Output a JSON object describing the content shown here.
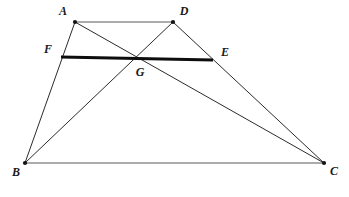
{
  "figure": {
    "canvas": {
      "width": 349,
      "height": 197,
      "background": "#ffffff"
    },
    "colors": {
      "thin_stroke": "#2b2b2b",
      "thin_stroke_light": "#585858",
      "thick_stroke": "#0d0d0d",
      "vertex": "#121212",
      "label": "#1a1a1a"
    },
    "points": [
      {
        "id": "A",
        "label": "A",
        "x": 75,
        "y": 22,
        "label_x": 63,
        "label_y": 12,
        "dot": true
      },
      {
        "id": "D",
        "label": "D",
        "x": 173,
        "y": 22,
        "label_x": 184,
        "label_y": 12,
        "dot": true
      },
      {
        "id": "F",
        "label": "F",
        "x": 61,
        "y": 57,
        "label_x": 48,
        "label_y": 50,
        "dot": false
      },
      {
        "id": "E",
        "label": "E",
        "x": 213,
        "y": 60,
        "label_x": 225,
        "label_y": 53,
        "dot": false
      },
      {
        "id": "G",
        "label": "G",
        "x": 138,
        "y": 58,
        "label_x": 140,
        "label_y": 73,
        "dot": false
      },
      {
        "id": "B",
        "label": "B",
        "x": 25,
        "y": 163,
        "label_x": 16,
        "label_y": 173,
        "dot": true
      },
      {
        "id": "C",
        "label": "C",
        "x": 324,
        "y": 163,
        "label_x": 334,
        "label_y": 172,
        "dot": true
      }
    ],
    "segments": [
      {
        "id": "AD",
        "from": "A",
        "to": "D",
        "weight": "thin-light",
        "desc": "top-side-ad"
      },
      {
        "id": "BC",
        "from": "B",
        "to": "C",
        "weight": "thin-light",
        "desc": "bottom-side-bc"
      },
      {
        "id": "AB",
        "from": "A",
        "to": "B",
        "weight": "thin",
        "desc": "left-side-ab"
      },
      {
        "id": "DC",
        "from": "D",
        "to": "C",
        "weight": "thin",
        "desc": "right-side-dc"
      },
      {
        "id": "AC",
        "from": "A",
        "to": "C",
        "weight": "thin",
        "desc": "diagonal-ac"
      },
      {
        "id": "BD",
        "from": "B",
        "to": "D",
        "weight": "thin",
        "desc": "diagonal-bd"
      },
      {
        "id": "FE",
        "from": "F",
        "to": "E",
        "weight": "thick",
        "desc": "midsegment-fe"
      }
    ]
  }
}
